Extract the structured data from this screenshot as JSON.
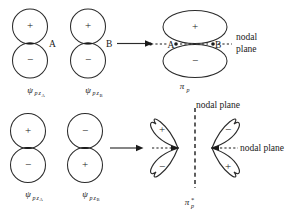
{
  "figure": {
    "stroke_color": "#2b2b2b",
    "text_color": "#1a1a1a",
    "background": "#ffffff"
  },
  "signs": {
    "plus": "+",
    "minus": "−"
  },
  "points": {
    "a": "A",
    "b": "B"
  },
  "labels": {
    "psi": "ψ",
    "psi_sub_p": "p",
    "psi_sub_z": "z",
    "sub_a": "A",
    "sub_b": "B",
    "pi": "π",
    "pi_sub_p": "p",
    "pi_star": "*",
    "nodal_plane_line1": "nodal",
    "nodal_plane_line2": "plane",
    "nodal_plane_full": "nodal plane"
  },
  "rows": [
    {
      "id": "bonding-row",
      "orbital_a": {
        "name": "psi-pz-A",
        "top_sign": "+",
        "bottom_sign": "−",
        "contact_point": "A"
      },
      "orbital_b": {
        "name": "psi-pz-B",
        "top_sign": "+",
        "bottom_sign": "−",
        "contact_point": "B"
      },
      "result": {
        "name": "pi-p-bonding",
        "symbol": "π",
        "subscript": "p",
        "top_sign": "+",
        "bottom_sign": "−",
        "nodal_planes": [
          "nodal plane"
        ]
      }
    },
    {
      "id": "antibonding-row",
      "orbital_a": {
        "name": "psi-pz-A",
        "top_sign": "+",
        "bottom_sign": "−",
        "contact_point": ""
      },
      "orbital_b": {
        "name": "psi-pz-B",
        "top_sign": "−",
        "bottom_sign": "+",
        "contact_point": ""
      },
      "result": {
        "name": "pi-p-antibonding",
        "symbol": "π",
        "subscript": "p",
        "superscript": "*",
        "left_top_sign": "+",
        "left_bottom_sign": "−",
        "right_top_sign": "−",
        "right_bottom_sign": "+",
        "nodal_planes": [
          "nodal plane",
          "nodal plane"
        ]
      }
    }
  ]
}
